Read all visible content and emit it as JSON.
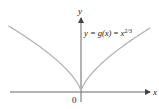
{
  "chart_data": {
    "type": "line",
    "title": "",
    "equation_label": {
      "prefix": "y = ",
      "g_of_x": "g(x)",
      "equals": " = ",
      "base": "x",
      "exponent": "2/3"
    },
    "xlabel": "x",
    "ylabel": "y",
    "origin_label": "0",
    "function": "x^(2/3)",
    "xlim": [
      -8.5,
      8.5
    ],
    "ylim": [
      -0.8,
      4.6
    ],
    "series": [
      {
        "name": "y = g(x) = x^(2/3)",
        "x": [
          -8,
          -6,
          -4,
          -2,
          -1,
          -0.5,
          0,
          0.5,
          1,
          2,
          4,
          6,
          8
        ],
        "y": [
          4.0,
          3.3,
          2.52,
          1.59,
          1.0,
          0.63,
          0,
          0.63,
          1.0,
          1.59,
          2.52,
          3.3,
          4.0
        ]
      }
    ],
    "grid": false,
    "legend": "none",
    "colors": {
      "curve": "#b5b5b5",
      "axes": "#555555"
    }
  }
}
